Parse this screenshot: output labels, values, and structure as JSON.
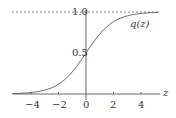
{
  "chart_data": {
    "type": "line",
    "title": "",
    "xlabel": "z",
    "ylabel": "",
    "series": [
      {
        "name": "q(z)",
        "function": "1/(1+exp(-z))",
        "x": [
          -5,
          -4,
          -3,
          -2,
          -1,
          0,
          1,
          2,
          3,
          4,
          5
        ],
        "values": [
          0.0067,
          0.018,
          0.047,
          0.119,
          0.269,
          0.5,
          0.731,
          0.881,
          0.953,
          0.982,
          0.993
        ]
      }
    ],
    "xticks": [
      "-4",
      "-2",
      "0",
      "2",
      "4"
    ],
    "yticks": [
      "0.5",
      "1.0"
    ],
    "xlim": [
      -5.3,
      5.3
    ],
    "ylim": [
      0,
      1
    ],
    "asymptote": {
      "y": 1.0,
      "style": "dashed"
    },
    "grid": false,
    "annotation": "q(z)"
  },
  "labels": {
    "curve": "q(z)",
    "xaxis": "z",
    "y_half": "0.5",
    "y_one": "1.0",
    "xt": [
      "−4",
      "−2",
      "0",
      "2",
      "4"
    ]
  }
}
